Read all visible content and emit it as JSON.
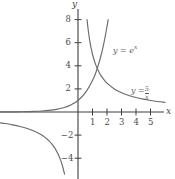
{
  "chart_data": {
    "type": "line",
    "title": "",
    "xlabel": "x",
    "ylabel": "y",
    "xlim": [
      -5.4,
      6.7
    ],
    "ylim": [
      -5.8,
      9.5
    ],
    "grid": false,
    "legend": "inline-annotations",
    "axis_color": "#3f3f3f",
    "curve_color": "#6b6b6b",
    "background": "#ffffff",
    "xticks": [
      1,
      2,
      3,
      4,
      5
    ],
    "xtick_labels": [
      "1",
      "2",
      "3",
      "4",
      "5"
    ],
    "yticks": [
      -4,
      -2,
      2,
      4,
      6,
      8
    ],
    "ytick_labels": [
      "-4",
      "-2",
      "2",
      "4",
      "6",
      "8"
    ],
    "series": [
      {
        "name": "y = e^x",
        "expression": "e^x",
        "label_text": "y = e",
        "label_exponent": "x",
        "color": "#6b6b6b",
        "points": [
          [
            -5.4,
            0.0045
          ],
          [
            -5.0,
            0.0067
          ],
          [
            -4.5,
            0.011
          ],
          [
            -4.0,
            0.018
          ],
          [
            -3.5,
            0.03
          ],
          [
            -3.0,
            0.05
          ],
          [
            -2.5,
            0.082
          ],
          [
            -2.0,
            0.135
          ],
          [
            -1.5,
            0.223
          ],
          [
            -1.0,
            0.368
          ],
          [
            -0.5,
            0.607
          ],
          [
            0.0,
            1.0
          ],
          [
            0.5,
            1.649
          ],
          [
            1.0,
            2.718
          ],
          [
            1.25,
            3.49
          ],
          [
            1.5,
            4.482
          ],
          [
            1.75,
            5.755
          ],
          [
            2.0,
            7.389
          ],
          [
            2.08,
            8.0
          ]
        ]
      },
      {
        "name": "y = 5/x",
        "expression": "5/x",
        "label_text": "y =",
        "label_numerator": "5",
        "label_denominator": "x",
        "color": "#6b6b6b",
        "branches": [
          {
            "quadrant": 1,
            "points": [
              [
                0.625,
                8.0
              ],
              [
                0.7,
                7.143
              ],
              [
                0.8,
                6.25
              ],
              [
                0.9,
                5.556
              ],
              [
                1.0,
                5.0
              ],
              [
                1.2,
                4.167
              ],
              [
                1.4,
                3.571
              ],
              [
                1.6,
                3.125
              ],
              [
                1.8,
                2.778
              ],
              [
                2.0,
                2.5
              ],
              [
                2.5,
                2.0
              ],
              [
                3.0,
                1.667
              ],
              [
                3.5,
                1.429
              ],
              [
                4.0,
                1.25
              ],
              [
                4.5,
                1.111
              ],
              [
                5.0,
                1.0
              ],
              [
                5.5,
                0.909
              ],
              [
                6.0,
                0.833
              ]
            ]
          },
          {
            "quadrant": 3,
            "points": [
              [
                -5.4,
                -0.926
              ],
              [
                -5.0,
                -1.0
              ],
              [
                -4.5,
                -1.111
              ],
              [
                -4.0,
                -1.25
              ],
              [
                -3.5,
                -1.429
              ],
              [
                -3.0,
                -1.667
              ],
              [
                -2.5,
                -2.0
              ],
              [
                -2.2,
                -2.273
              ],
              [
                -2.0,
                -2.5
              ],
              [
                -1.8,
                -2.778
              ],
              [
                -1.6,
                -3.125
              ],
              [
                -1.4,
                -3.571
              ],
              [
                -1.2,
                -4.167
              ],
              [
                -1.05,
                -4.762
              ],
              [
                -0.93,
                -5.38
              ]
            ]
          }
        ]
      }
    ],
    "annotations": [
      {
        "id": "label-exp",
        "text": "y = e^x",
        "x": 2.5,
        "y": 5.6
      },
      {
        "id": "label-hyp",
        "text": "y = 5/x",
        "x": 3.6,
        "y": 2.4
      }
    ]
  },
  "axis_labels": {
    "x": "x",
    "y": "y"
  }
}
